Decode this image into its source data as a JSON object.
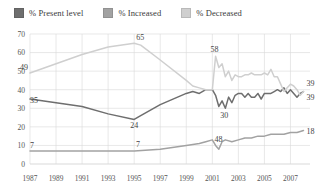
{
  "legend": {
    "position": "top-left",
    "items": [
      {
        "label": "% Present level",
        "color": "#6e6e6e",
        "key": "present"
      },
      {
        "label": "% Increased",
        "color": "#a2a2a2",
        "key": "increased"
      },
      {
        "label": "% Decreased",
        "color": "#cfcfcf",
        "key": "decreased"
      }
    ]
  },
  "chart_data": {
    "type": "line",
    "title": "",
    "subtitle": "",
    "xlabel": "",
    "ylabel": "",
    "grid": true,
    "legend_position": "top-left",
    "xlim": [
      1987,
      2008.5
    ],
    "ylim": [
      0,
      70
    ],
    "yticks": [
      0,
      10,
      20,
      30,
      40,
      50,
      60,
      70
    ],
    "ytick_labels": [
      "0",
      "10",
      "20",
      "30",
      "40",
      "50",
      "60",
      "70"
    ],
    "xticks": [
      1987,
      1989,
      1991,
      1993,
      1995,
      1997,
      1999,
      2001,
      2003,
      2005,
      2007
    ],
    "xtick_labels": [
      "1987",
      "1989",
      "1991",
      "1993",
      "1995",
      "1997",
      "1999",
      "2001",
      "2003",
      "2005",
      "2007"
    ],
    "series": [
      {
        "name": "% Present level",
        "color": "#6e6e6e",
        "x": [
          1987,
          1989,
          1991,
          1993,
          1995,
          1995.5,
          1997,
          1999,
          1999.5,
          2000,
          2000.5,
          2001,
          2001.25,
          2001.5,
          2001.75,
          2002,
          2002.25,
          2002.5,
          2002.75,
          2003,
          2003.25,
          2003.5,
          2003.75,
          2004,
          2004.25,
          2004.5,
          2004.75,
          2005,
          2005.25,
          2005.5,
          2005.75,
          2006,
          2006.25,
          2006.5,
          2006.75,
          2007,
          2007.25,
          2007.5,
          2007.75,
          2008
        ],
        "values": [
          35,
          33,
          31,
          27,
          24,
          26,
          32,
          38,
          39,
          38,
          40,
          40,
          37,
          31,
          34,
          30,
          36,
          33,
          37,
          38,
          38,
          36,
          38,
          36,
          36,
          38,
          35,
          38,
          38,
          38,
          39,
          40,
          39,
          41,
          38,
          40,
          38,
          36,
          38,
          39
        ]
      },
      {
        "name": "% Increased",
        "color": "#a2a2a2",
        "x": [
          1987,
          1989,
          1991,
          1993,
          1995,
          1997,
          1999,
          2000,
          2000.5,
          2001,
          2001.25,
          2001.5,
          2001.75,
          2002,
          2002.5,
          2003,
          2003.5,
          2004,
          2004.5,
          2005,
          2005.5,
          2006,
          2006.5,
          2007,
          2007.5,
          2008
        ],
        "values": [
          7,
          7,
          7,
          7,
          7,
          8,
          10,
          11,
          12,
          13,
          10,
          8,
          12,
          13,
          12,
          13,
          14,
          14,
          15,
          15,
          16,
          16,
          16,
          17,
          17,
          18
        ]
      },
      {
        "name": "% Decreased",
        "color": "#cfcfcf",
        "x": [
          1987,
          1989,
          1991,
          1993,
          1995,
          1995.5,
          1997,
          1999,
          1999.5,
          2000,
          2000.5,
          2001,
          2001.25,
          2001.5,
          2001.75,
          2002,
          2002.25,
          2002.5,
          2002.75,
          2003,
          2003.25,
          2003.5,
          2003.75,
          2004,
          2004.25,
          2004.5,
          2004.75,
          2005,
          2005.25,
          2005.5,
          2005.75,
          2006,
          2006.25,
          2006.5,
          2006.75,
          2007,
          2007.25,
          2007.5,
          2007.75,
          2008
        ],
        "values": [
          49,
          54,
          59,
          63,
          65,
          64,
          56,
          45,
          42,
          41,
          40,
          40,
          58,
          52,
          54,
          47,
          50,
          45,
          48,
          47,
          47,
          48,
          48,
          49,
          48,
          48,
          48,
          49,
          48,
          51,
          47,
          47,
          43,
          39,
          41,
          43,
          42,
          40,
          37,
          39
        ]
      }
    ],
    "annotations": [
      {
        "text": "49",
        "x": 1987,
        "y": 49,
        "anchor": "end",
        "dx": -2,
        "dy": -3
      },
      {
        "text": "35",
        "x": 1987,
        "y": 35,
        "anchor": "start",
        "dx": 0,
        "dy": 4
      },
      {
        "text": "7",
        "x": 1987,
        "y": 7,
        "anchor": "start",
        "dx": 0,
        "dy": -3
      },
      {
        "text": "65",
        "x": 1995,
        "y": 65,
        "anchor": "start",
        "dx": 2,
        "dy": -3
      },
      {
        "text": "24",
        "x": 1995,
        "y": 24,
        "anchor": "middle",
        "dx": 0,
        "dy": 9
      },
      {
        "text": "7",
        "x": 1995.3,
        "y": 7,
        "anchor": "middle",
        "dx": 0,
        "dy": -4
      },
      {
        "text": "58",
        "x": 2001.25,
        "y": 58,
        "anchor": "middle",
        "dx": -1,
        "dy": -4
      },
      {
        "text": "30",
        "x": 2002,
        "y": 30,
        "anchor": "middle",
        "dx": -1,
        "dy": 10
      },
      {
        "text": "48",
        "x": 2001.4,
        "y": 11,
        "anchor": "middle",
        "dx": 1,
        "dy": -2
      },
      {
        "text": "39",
        "x": 2008,
        "y": 39,
        "anchor": "start",
        "dx": 3,
        "dy": -6
      },
      {
        "text": "39",
        "x": 2008,
        "y": 39,
        "anchor": "start",
        "dx": 3,
        "dy": 8
      },
      {
        "text": "18",
        "x": 2008,
        "y": 18,
        "anchor": "start",
        "dx": 3,
        "dy": 3
      }
    ]
  }
}
